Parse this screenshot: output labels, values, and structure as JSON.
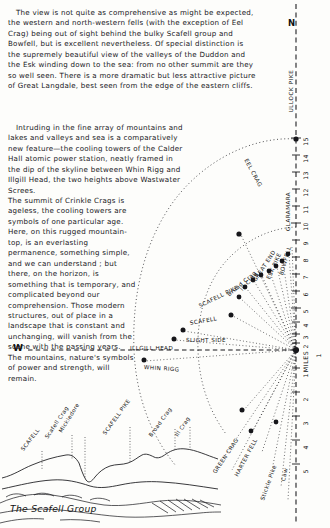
{
  "prose": {
    "paragraph_1": "The view is not quite as comprehensive as might be expected, the western and north-western fells (with the exception of Eel Crag) being out of sight behind the bulky Scafell group and Bowfell, but is excellent nevertheless. Of special distinction is the supremely beautiful view of the valleys of the Duddon and the Esk winding down to the sea: from no other summit are they so well seen. There is a more dramatic but less attractive picture of Great Langdale, best seen from the edge of the eastern cliffs.",
    "paragraph_2": "Intruding in the fine array of mountains and lakes and valleys and sea is a comparatively new feature—the cooling towers of the Calder Hall atomic power station, neatly framed in the dip of the skyline between Whin Rigg and Illgill Head, the two heights above Wastwater Screes.",
    "paragraph_3_a": "The summit of Crinkle Crags is ageless, the cooling towers are symbols of one particular age.  Here, on this rugged mountain-top, is an everlasting permanence, something simple, and we can understand ; but ",
    "paragraph_3_italic": "there",
    "paragraph_3_b": ", on the horizon, is something that is temporary, and complicated beyond our comprehension. Those modern structures, out of place in a landscape that is constant and unchanging, will vanish from the scene with the passing years. The mountains, nature's symbols of power and strength, will remain."
  },
  "diagram": {
    "north_marker": "N",
    "west_marker": "W",
    "north_line_label": "ULLOCK PIKE",
    "scale_unit_label": "MILES",
    "scale_numbers": [
      "15",
      "14",
      "13",
      "12",
      "11",
      "10",
      "9",
      "8",
      "7",
      "6",
      "5",
      "4",
      "3",
      "2",
      "1",
      "1",
      "2",
      "3",
      "4",
      "5"
    ],
    "scale_center_label": "1",
    "peaks": [
      {
        "name": "EEL CRAG",
        "style": "upper"
      },
      {
        "name": "GLARAMARA",
        "style": "upper"
      },
      {
        "name": "BOWFELL",
        "style": "upper"
      },
      {
        "name": "ESK PIKE",
        "style": "upper"
      },
      {
        "name": "GREAT END",
        "style": "upper"
      },
      {
        "name": "Ill Crag",
        "style": "mixed"
      },
      {
        "name": "Broad Crag",
        "style": "mixed"
      },
      {
        "name": "SCAFELL PIKE",
        "style": "upper"
      },
      {
        "name": "SCAFELL",
        "style": "upper"
      },
      {
        "name": "SLIGHT SIDE",
        "style": "upper"
      },
      {
        "name": "ILLGILL HEAD",
        "style": "upper"
      },
      {
        "name": "WHIN RIGG",
        "style": "upper"
      },
      {
        "name": "GREEN CRAG",
        "style": "upper"
      },
      {
        "name": "HARTER FELL",
        "style": "upper"
      },
      {
        "name": "Stickle Pike",
        "style": "mixed"
      },
      {
        "name": "Caw",
        "style": "mixed"
      }
    ]
  },
  "panorama": {
    "caption": "The Scafell Group",
    "labels": [
      {
        "name": "SCAFELL"
      },
      {
        "name": "Scafell Crag"
      },
      {
        "name": "Mickledore"
      },
      {
        "name": "SCAFELL PIKE"
      },
      {
        "name": "Broad Crag"
      },
      {
        "name": "Ill Crag"
      }
    ]
  },
  "colors": {
    "ink": "#16161a",
    "paper": "#fdfdfb"
  }
}
